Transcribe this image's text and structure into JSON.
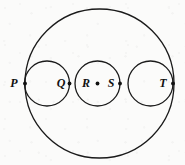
{
  "figure": {
    "background_color": "#fbfbfa",
    "stroke_color": "#1a1a1a",
    "label_color": "#111111",
    "width": 185,
    "height": 165
  },
  "chart_data": {
    "type": "diagram",
    "title": "",
    "shapes": [
      {
        "name": "outer-circle",
        "kind": "circle",
        "cx": 99.5,
        "cy": 83.5,
        "r": 74.5,
        "stroke_width": 1.3
      },
      {
        "name": "small-circle-left",
        "kind": "circle",
        "cx": 47.0,
        "cy": 83.5,
        "r": 22.5,
        "stroke_width": 1.3
      },
      {
        "name": "small-circle-middle",
        "kind": "circle",
        "cx": 97.5,
        "cy": 83.5,
        "r": 22.5,
        "stroke_width": 1.3
      },
      {
        "name": "small-circle-right",
        "kind": "circle",
        "cx": 150.5,
        "cy": 83.5,
        "r": 22.5,
        "stroke_width": 1.3
      }
    ],
    "points": [
      {
        "label": "P",
        "x": 25.0,
        "y": 83.5,
        "dot_r": 1.9,
        "label_x": 14.0,
        "label_y": 84.0,
        "anchor": "middle"
      },
      {
        "label": "Q",
        "x": 69.5,
        "y": 83.5,
        "dot_r": 1.9,
        "label_x": 61.0,
        "label_y": 84.0,
        "anchor": "middle"
      },
      {
        "label": "R",
        "x": 97.5,
        "y": 83.5,
        "dot_r": 1.9,
        "label_x": 86.0,
        "label_y": 84.0,
        "anchor": "middle"
      },
      {
        "label": "S",
        "x": 120.0,
        "y": 83.5,
        "dot_r": 1.9,
        "label_x": 111.0,
        "label_y": 84.0,
        "anchor": "middle"
      },
      {
        "label": "T",
        "x": 173.0,
        "y": 83.5,
        "dot_r": 1.9,
        "label_x": 163.0,
        "label_y": 84.0,
        "anchor": "middle"
      }
    ],
    "label_font_size": 12,
    "xlabel": "",
    "ylabel": "",
    "legend": [],
    "grid": false
  }
}
